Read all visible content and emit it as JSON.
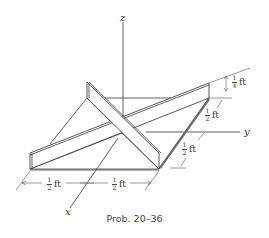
{
  "figure": {
    "caption": "Prob. 20–36",
    "axes": {
      "x": "x",
      "y": "y",
      "z": "z"
    },
    "dimensions": [
      {
        "id": "plate-height",
        "num": "1",
        "den": "4",
        "unit": "ft"
      },
      {
        "id": "right-upper",
        "num": "1",
        "den": "2",
        "unit": "ft"
      },
      {
        "id": "right-lower",
        "num": "1",
        "den": "2",
        "unit": "ft"
      },
      {
        "id": "bottom-left",
        "num": "1",
        "den": "2",
        "unit": "ft"
      },
      {
        "id": "bottom-right",
        "num": "1",
        "den": "2",
        "unit": "ft"
      }
    ],
    "colors": {
      "line": "#3a3a3a",
      "background": "#ffffff"
    }
  }
}
